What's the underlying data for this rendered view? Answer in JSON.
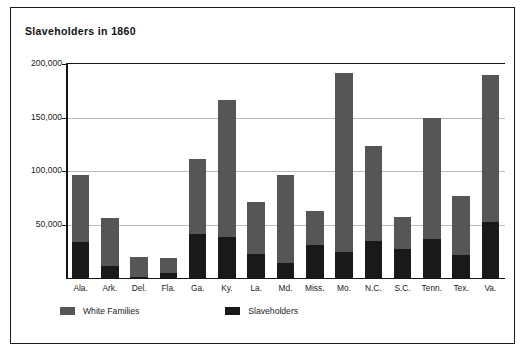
{
  "figure": {
    "title": "Slaveholders in 1860",
    "border_color": "#1a1a1a",
    "background": "#ffffff"
  },
  "legend": {
    "position": "bottom-left",
    "items": [
      {
        "label": "White Families",
        "color": "#565656",
        "swatch_name": "white-families-swatch"
      },
      {
        "label": "Slaveholders",
        "color": "#191919",
        "swatch_name": "slaveholders-swatch"
      }
    ]
  },
  "axes": {
    "y_ticks": [
      "200,000",
      "150,000",
      "100,000",
      "50,000"
    ],
    "y_tick_values": [
      200000,
      150000,
      100000,
      50000
    ],
    "x_labels": [
      "Ala.",
      "Ark.",
      "Del.",
      "Fla.",
      "Ga.",
      "Ky.",
      "La.",
      "Md.",
      "Miss.",
      "Mo.",
      "N.C.",
      "S.C.",
      "Tenn.",
      "Tex.",
      "Va."
    ]
  },
  "chart_data": {
    "type": "bar",
    "subtype": "stacked-vertical",
    "title": "Slaveholders in 1860",
    "xlabel": "",
    "ylabel": "",
    "ylim": [
      0,
      200000
    ],
    "grid": true,
    "grid_axis": "y",
    "legend_position": "bottom-left",
    "categories": [
      "Ala.",
      "Ark.",
      "Del.",
      "Fla.",
      "Ga.",
      "Ky.",
      "La.",
      "Md.",
      "Miss.",
      "Mo.",
      "N.C.",
      "S.C.",
      "Tenn.",
      "Tex.",
      "Va."
    ],
    "series": [
      {
        "name": "Slaveholders",
        "color": "#191919",
        "values": [
          34000,
          11500,
          600,
          5000,
          41000,
          38500,
          22000,
          13800,
          31000,
          24300,
          34600,
          26700,
          36800,
          21900,
          52100
        ]
      },
      {
        "name": "White Families",
        "color": "#565656",
        "stack_note": "plotted above Slaveholders; value shown is remainder of total",
        "values": [
          62000,
          44500,
          19400,
          14000,
          70000,
          127500,
          49000,
          82200,
          32000,
          167700,
          88400,
          30300,
          113200,
          55100,
          137900
        ]
      }
    ],
    "totals": [
      96000,
      56000,
      20000,
      19000,
      111000,
      166000,
      71000,
      96000,
      63000,
      192000,
      123000,
      57000,
      150000,
      77000,
      190000
    ]
  }
}
